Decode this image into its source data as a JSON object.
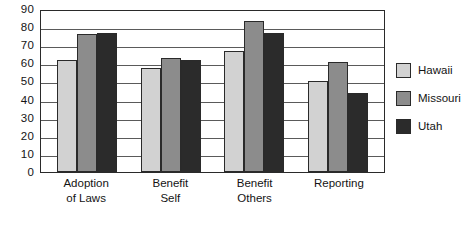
{
  "chart_data": {
    "type": "bar",
    "title": "",
    "xlabel": "",
    "ylabel": "",
    "ylim": [
      0,
      90
    ],
    "ytick_step": 10,
    "yticks": [
      90,
      80,
      70,
      60,
      50,
      40,
      30,
      20,
      10,
      0
    ],
    "grid": true,
    "legend_position": "right",
    "categories": [
      "Adoption of Laws",
      "Benefit Self",
      "Benefit Others",
      "Reporting"
    ],
    "category_lines": [
      [
        "Adoption",
        "of Laws"
      ],
      [
        "Benefit",
        "Self"
      ],
      [
        "Benefit",
        "Others"
      ],
      [
        "Reporting"
      ]
    ],
    "series": [
      {
        "name": "Hawaii",
        "color": "#d2d2d2",
        "values": [
          62,
          57.5,
          67,
          50
        ]
      },
      {
        "name": "Missouri",
        "color": "#8c8c8c",
        "values": [
          76,
          63,
          83.5,
          61
        ]
      },
      {
        "name": "Utah",
        "color": "#2b2b2b",
        "values": [
          76.5,
          62,
          77,
          43.5
        ]
      }
    ]
  },
  "colors": {
    "axis": "#2a2a2a",
    "gridline": "#5a5a5a",
    "background": "#ffffff",
    "text": "#141414"
  }
}
